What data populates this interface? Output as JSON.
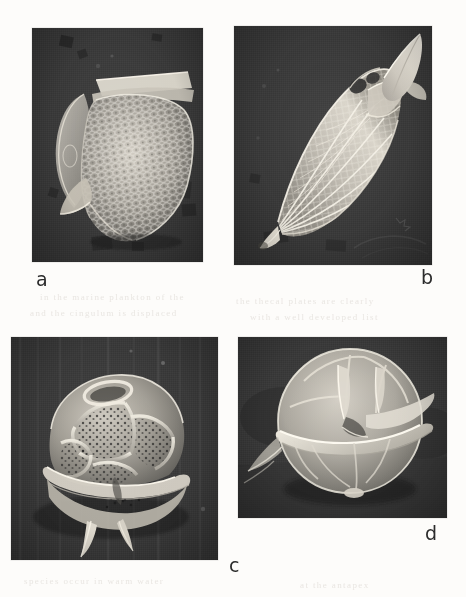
{
  "figure": {
    "kind": "scanning-electron-micrograph-plate",
    "background_color": "#fdfcfa",
    "panel_background_color": "#3a3a3a",
    "specimen_color": "#d8d4cc",
    "label_color": "#2b2b2b",
    "panel_count": 4,
    "ghost_text": [
      {
        "text": "in the  marine  plankton  of  the",
        "x": 40,
        "y": 292
      },
      {
        "text": "the  thecal  plates  are  clearly",
        "x": 236,
        "y": 296
      },
      {
        "text": "and  the  cingulum  is  displaced",
        "x": 30,
        "y": 308
      },
      {
        "text": "with  a  well  developed  list",
        "x": 250,
        "y": 312
      },
      {
        "text": "species  occur  in  warm  water",
        "x": 24,
        "y": 576
      },
      {
        "text": "at  the  antapex",
        "x": 300,
        "y": 580
      }
    ]
  },
  "panels": [
    {
      "id": "a",
      "label": "a",
      "label_x": 36,
      "label_y": 270,
      "x": 32,
      "y": 28,
      "width": 171,
      "height": 234,
      "specimen": "reticulate-thecate-dinoflagellate-lateral",
      "description": "Ovoid cell with coarsely reticulate surface, apical plate collar and antapical flange"
    },
    {
      "id": "b",
      "label": "b",
      "label_x": 421,
      "label_y": 268,
      "x": 234,
      "y": 26,
      "width": 198,
      "height": 239,
      "specimen": "fusiform-ribbed-dinoflagellate-with-apical-horn",
      "description": "Elongate spindle cell with longitudinal ribs, reticulate mesh, pointed apical horn and antapical spine"
    },
    {
      "id": "c",
      "label": "c",
      "label_x": 229,
      "label_y": 556,
      "x": 11,
      "y": 337,
      "width": 207,
      "height": 223,
      "specimen": "plated-dinoflagellate-with-antapical-spines",
      "description": "Cell showing polygonal thecal plates with scattered pores, displaced cingulum and two antapical spines"
    },
    {
      "id": "d",
      "label": "d",
      "label_x": 425,
      "label_y": 524,
      "x": 238,
      "y": 337,
      "width": 209,
      "height": 181,
      "specimen": "smooth-round-dinoflagellate-ventral",
      "description": "Rounded smooth-walled cell in ventral view with prominent cingulum list and sulcal plates"
    }
  ]
}
